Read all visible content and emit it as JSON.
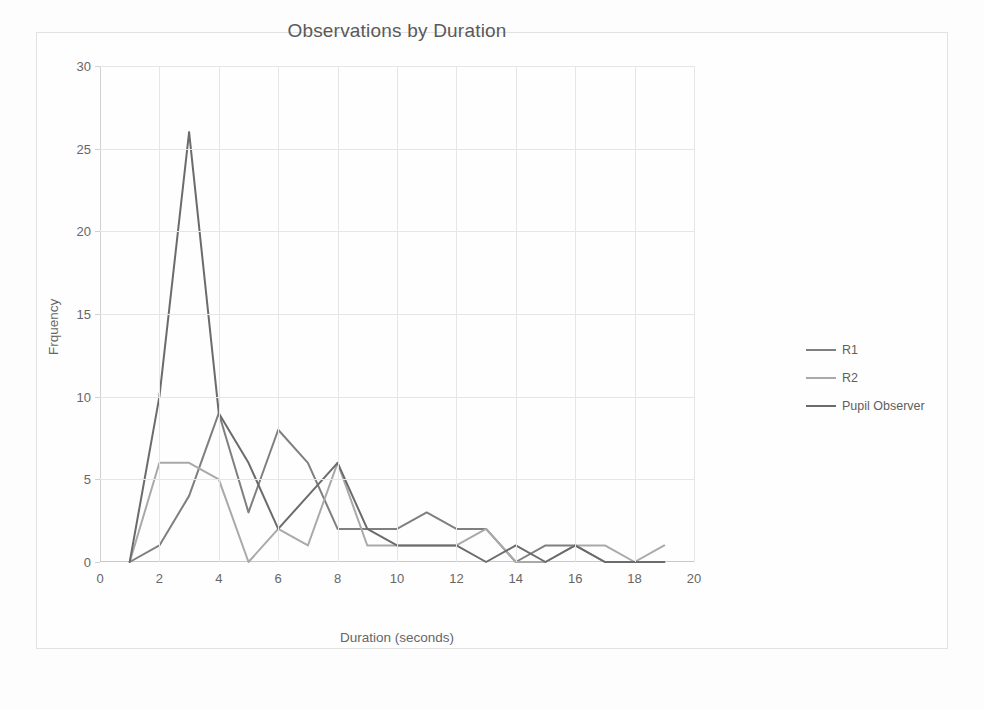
{
  "chart_data": {
    "type": "line",
    "title": "Observations by Duration",
    "xlabel": "Duration (seconds)",
    "ylabel": "Frquency",
    "xlim": [
      0,
      20
    ],
    "ylim": [
      0,
      30
    ],
    "xticks": [
      0,
      2,
      4,
      6,
      8,
      10,
      12,
      14,
      16,
      18,
      20
    ],
    "yticks": [
      0,
      5,
      10,
      15,
      20,
      25,
      30
    ],
    "grid": true,
    "legend_position": "right",
    "x": [
      1,
      2,
      3,
      4,
      5,
      6,
      7,
      8,
      9,
      10,
      11,
      12,
      13,
      14,
      15,
      16,
      17,
      18,
      19
    ],
    "series": [
      {
        "name": "R1",
        "color": "#7f7f7f",
        "values": [
          0,
          1,
          4,
          9,
          3,
          8,
          6,
          2,
          2,
          2,
          3,
          2,
          2,
          0,
          1,
          1,
          0,
          0,
          0
        ]
      },
      {
        "name": "R2",
        "color": "#a9a9a9",
        "values": [
          0,
          6,
          6,
          5,
          0,
          2,
          1,
          6,
          1,
          1,
          1,
          1,
          2,
          0,
          0,
          1,
          1,
          0,
          1
        ]
      },
      {
        "name": "Pupil Observer",
        "color": "#6b6b6b",
        "values": [
          0,
          10,
          26,
          9,
          6,
          2,
          4,
          6,
          2,
          1,
          1,
          1,
          0,
          1,
          0,
          1,
          0,
          0,
          0
        ]
      }
    ]
  },
  "legend": {
    "items": [
      {
        "label": "R1"
      },
      {
        "label": "R2"
      },
      {
        "label": "Pupil Observer"
      }
    ]
  },
  "colors": {
    "background": "#fdfdfd",
    "frame_border": "#e2e2e2",
    "gridline": "#e6e6e6",
    "axis": "#d0d0d0",
    "text": "#666666",
    "title_text": "#5a5a5a"
  }
}
